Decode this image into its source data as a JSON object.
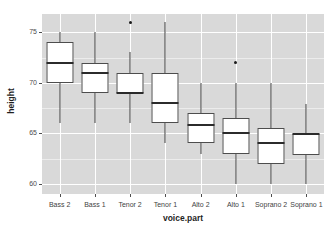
{
  "chart_data": {
    "type": "box",
    "title": "",
    "xlabel": "voice.part",
    "ylabel": "height",
    "ylim": [
      59.0,
      76.8
    ],
    "yticks": [
      60,
      65,
      70,
      75
    ],
    "ytick_labels": [
      "60",
      "75",
      "70",
      "65"
    ],
    "grid": true,
    "legend": "none",
    "categories": [
      "Bass 2",
      "Bass 1",
      "Tenor 2",
      "Tenor 1",
      "Alto 2",
      "Alto 1",
      "Soprano 2",
      "Soprano 1"
    ],
    "boxes": [
      {
        "category": "Bass 2",
        "whisker_low": 66.0,
        "q1": 70.0,
        "median": 72.0,
        "q3": 74.0,
        "whisker_high": 75.0,
        "outliers": []
      },
      {
        "category": "Bass 1",
        "whisker_low": 66.0,
        "q1": 69.0,
        "median": 71.0,
        "q3": 72.0,
        "whisker_high": 75.0,
        "outliers": []
      },
      {
        "category": "Tenor 2",
        "whisker_low": 66.0,
        "q1": 69.0,
        "median": 69.0,
        "q3": 71.0,
        "whisker_high": 73.0,
        "outliers": [
          76.0
        ]
      },
      {
        "category": "Tenor 1",
        "whisker_low": 64.0,
        "q1": 66.0,
        "median": 68.0,
        "q3": 71.0,
        "whisker_high": 76.0,
        "outliers": []
      },
      {
        "category": "Alto 2",
        "whisker_low": 63.0,
        "q1": 64.0,
        "median": 65.8,
        "q3": 67.0,
        "whisker_high": 70.0,
        "outliers": []
      },
      {
        "category": "Alto 1",
        "whisker_low": 60.0,
        "q1": 63.0,
        "median": 65.0,
        "q3": 66.5,
        "whisker_high": 70.0,
        "outliers": [
          72.0
        ]
      },
      {
        "category": "Soprano 2",
        "whisker_low": 60.0,
        "q1": 62.0,
        "median": 64.0,
        "q3": 65.5,
        "whisker_high": 70.0,
        "outliers": []
      },
      {
        "category": "Soprano 1",
        "whisker_low": 60.0,
        "q1": 62.8,
        "median": 64.9,
        "q3": 64.9,
        "whisker_high": 67.9,
        "outliers": []
      }
    ]
  },
  "style": {
    "panel_background": "#d9d9d9",
    "major_grid_color": "#ffffff",
    "minor_grid_color": "#ececec",
    "box_fill": "#ffffff",
    "box_stroke": "#4d4d4d",
    "median_color": "#2b2b2b",
    "outlier_color": "#1a1a1a",
    "axis_text_color": "#4d4d4d",
    "axis_title_color": "#1f1f1f",
    "page_background": "#ffffff"
  }
}
